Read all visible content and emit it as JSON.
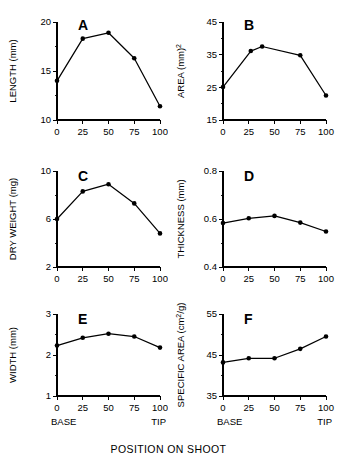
{
  "figure": {
    "xaxis_caption": "POSITION ON SHOOT",
    "base_label": "BASE",
    "tip_label": "TIP",
    "line_color": "#000000",
    "marker_color": "#000000",
    "background_color": "#ffffff"
  },
  "chart_data": [
    {
      "type": "line",
      "panel": "A",
      "title": "A",
      "xlabel": "POSITION ON SHOOT",
      "ylabel": "LENGTH (mm)",
      "ylabel_text": "LENGTH",
      "ylabel_units": "(mm)",
      "x": [
        0,
        25,
        50,
        75,
        100
      ],
      "values": [
        14.0,
        18.3,
        18.9,
        16.3,
        11.4
      ],
      "xlim": [
        0,
        100
      ],
      "ylim": [
        10,
        20
      ],
      "xticks": [
        0,
        25,
        50,
        75,
        100
      ],
      "xticklabels": [
        "0",
        "25",
        "50",
        "75",
        "100"
      ],
      "yticks": [
        10,
        15,
        20
      ],
      "yticklabels": [
        "10",
        "15",
        "20"
      ],
      "yminorticks": [
        12.5,
        17.5
      ],
      "grid": false,
      "legend": "none"
    },
    {
      "type": "line",
      "panel": "B",
      "title": "B",
      "xlabel": "POSITION ON SHOOT",
      "ylabel": "AREA (mm)2",
      "ylabel_text": "AREA",
      "ylabel_units": "(mm)",
      "ylabel_superscript": "2",
      "x": [
        0,
        27,
        38,
        75,
        100
      ],
      "values": [
        25.1,
        36.1,
        37.5,
        34.8,
        22.5
      ],
      "xlim": [
        0,
        100
      ],
      "ylim": [
        15,
        45
      ],
      "xticks": [
        0,
        25,
        50,
        75,
        100
      ],
      "xticklabels": [
        "0",
        "25",
        "50",
        "75",
        "100"
      ],
      "yticks": [
        15,
        25,
        35,
        45
      ],
      "yticklabels": [
        "15",
        "25",
        "35",
        "45"
      ],
      "yminorticks": [
        20,
        30,
        40
      ],
      "grid": false,
      "legend": "none"
    },
    {
      "type": "line",
      "panel": "C",
      "title": "C",
      "xlabel": "POSITION ON SHOOT",
      "ylabel": "DRY WEIGHT (mg)",
      "ylabel_text": "DRY WEIGHT",
      "ylabel_units": "(mg)",
      "x": [
        0,
        25,
        50,
        75,
        100
      ],
      "values": [
        6.0,
        8.3,
        8.9,
        7.3,
        4.8
      ],
      "xlim": [
        0,
        100
      ],
      "ylim": [
        2,
        10
      ],
      "xticks": [
        0,
        25,
        50,
        75,
        100
      ],
      "xticklabels": [
        "0",
        "25",
        "50",
        "75",
        "100"
      ],
      "yticks": [
        2,
        6,
        10
      ],
      "yticklabels": [
        "2",
        "6",
        "10"
      ],
      "yminorticks": [
        4,
        8
      ],
      "grid": false,
      "legend": "none"
    },
    {
      "type": "line",
      "panel": "D",
      "title": "D",
      "xlabel": "POSITION ON SHOOT",
      "ylabel": "THICKNESS (mm)",
      "ylabel_text": "THICKNESS",
      "ylabel_units": "(mm)",
      "x": [
        0,
        25,
        50,
        75,
        100
      ],
      "values": [
        0.583,
        0.603,
        0.613,
        0.585,
        0.548
      ],
      "xlim": [
        0,
        100
      ],
      "ylim": [
        0.4,
        0.8
      ],
      "xticks": [
        0,
        25,
        50,
        75,
        100
      ],
      "xticklabels": [
        "0",
        "25",
        "50",
        "75",
        "100"
      ],
      "yticks": [
        0.4,
        0.6,
        0.8
      ],
      "yticklabels": [
        "0.4",
        "0.6",
        "0.8"
      ],
      "yminorticks": [
        0.5,
        0.7
      ],
      "grid": false,
      "legend": "none"
    },
    {
      "type": "line",
      "panel": "E",
      "title": "E",
      "xlabel": "POSITION ON SHOOT",
      "ylabel": "WIDTH (mm)",
      "ylabel_text": "WIDTH",
      "ylabel_units": "(mm)",
      "x": [
        0,
        25,
        50,
        75,
        100
      ],
      "values": [
        2.23,
        2.42,
        2.52,
        2.45,
        2.18
      ],
      "xlim": [
        0,
        100
      ],
      "ylim": [
        1,
        3
      ],
      "xticks": [
        0,
        25,
        50,
        75,
        100
      ],
      "xticklabels": [
        "0",
        "25",
        "50",
        "75",
        "100"
      ],
      "yticks": [
        1,
        2,
        3
      ],
      "yticklabels": [
        "1",
        "2",
        "3"
      ],
      "yminorticks": [
        1.5,
        2.5
      ],
      "grid": false,
      "legend": "none"
    },
    {
      "type": "line",
      "panel": "F",
      "title": "F",
      "xlabel": "POSITION ON SHOOT",
      "ylabel": "SPECIFIC AREA (cm2/g)",
      "ylabel_text": "SPECIFIC AREA",
      "ylabel_units": "(cm",
      "ylabel_superscript": "2",
      "ylabel_units_tail": "/g)",
      "x": [
        0,
        25,
        50,
        75,
        100
      ],
      "values": [
        43.2,
        44.2,
        44.2,
        46.5,
        49.5
      ],
      "xlim": [
        0,
        100
      ],
      "ylim": [
        35,
        55
      ],
      "xticks": [
        0,
        25,
        50,
        75,
        100
      ],
      "xticklabels": [
        "0",
        "25",
        "50",
        "75",
        "100"
      ],
      "yticks": [
        35,
        45,
        55
      ],
      "yticklabels": [
        "35",
        "45",
        "55"
      ],
      "yminorticks": [
        40,
        50
      ],
      "grid": false,
      "legend": "none"
    }
  ]
}
